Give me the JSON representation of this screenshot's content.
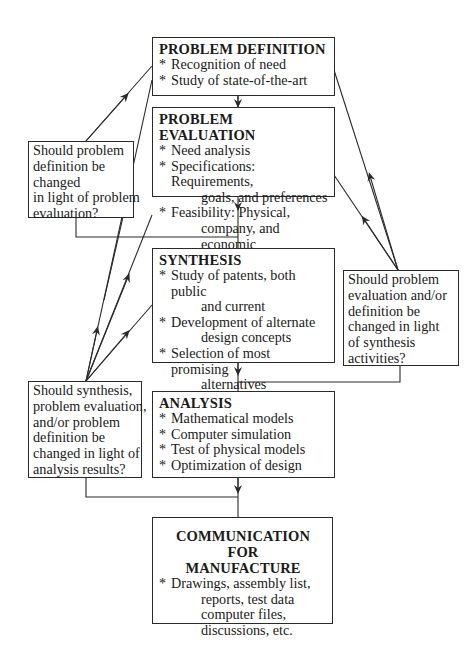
{
  "diagram": {
    "type": "flowchart",
    "stages": [
      {
        "id": "problem-definition",
        "title": "PROBLEM DEFINITION",
        "items": [
          {
            "bullet": "*",
            "lines": [
              "Recognition of need"
            ]
          },
          {
            "bullet": "*",
            "lines": [
              "Study of state-of-the-art"
            ]
          }
        ]
      },
      {
        "id": "problem-evaluation",
        "title": "PROBLEM EVALUATION",
        "items": [
          {
            "bullet": "*",
            "lines": [
              "Need analysis"
            ]
          },
          {
            "bullet": "*",
            "lines": [
              "Specifications:  Requirements,",
              "goals, and preferences"
            ]
          },
          {
            "bullet": "*",
            "lines": [
              "Feasibility:  Physical,",
              "company, and economic"
            ]
          }
        ]
      },
      {
        "id": "synthesis",
        "title": "SYNTHESIS",
        "items": [
          {
            "bullet": "*",
            "lines": [
              "Study of patents, both public",
              "and current"
            ]
          },
          {
            "bullet": "*",
            "lines": [
              "Development of alternate",
              "design concepts"
            ]
          },
          {
            "bullet": "*",
            "lines": [
              "Selection of most promising",
              "alternatives"
            ]
          }
        ]
      },
      {
        "id": "analysis",
        "title": "ANALYSIS",
        "items": [
          {
            "bullet": "*",
            "lines": [
              "Mathematical models"
            ]
          },
          {
            "bullet": "*",
            "lines": [
              "Computer simulation"
            ]
          },
          {
            "bullet": "*",
            "lines": [
              "Test of physical models"
            ]
          },
          {
            "bullet": "*",
            "lines": [
              "Optimization of design"
            ]
          }
        ]
      },
      {
        "id": "communication",
        "title_lines": [
          "COMMUNICATION FOR",
          "MANUFACTURE"
        ],
        "items": [
          {
            "bullet": "*",
            "lines": [
              "Drawings, assembly list,",
              "reports, test data",
              "computer files,",
              "discussions, etc."
            ]
          }
        ]
      }
    ],
    "questions": [
      {
        "id": "q-after-evaluation",
        "lines": [
          "Should problem",
          "definition be",
          "changed",
          "in light of problem",
          "evaluation?"
        ],
        "feeds_back_to": [
          "problem-definition"
        ]
      },
      {
        "id": "q-after-synthesis",
        "lines": [
          "Should problem",
          "evaluation and/or",
          "definition be",
          "changed in light",
          "of synthesis",
          "activities?"
        ],
        "feeds_back_to": [
          "problem-evaluation",
          "problem-definition"
        ]
      },
      {
        "id": "q-after-analysis",
        "lines": [
          "Should synthesis,",
          "problem evaluation,",
          "and/or problem",
          "definition be",
          "changed in light of",
          "analysis results?"
        ],
        "feeds_back_to": [
          "synthesis",
          "problem-evaluation",
          "problem-definition"
        ]
      }
    ],
    "flow": [
      "problem-definition -> problem-evaluation",
      "problem-evaluation -> synthesis",
      "synthesis -> analysis",
      "analysis -> communication"
    ],
    "colors": {
      "line": "#2a2a2a",
      "text": "#1a1a1a",
      "background": "#ffffff"
    }
  }
}
